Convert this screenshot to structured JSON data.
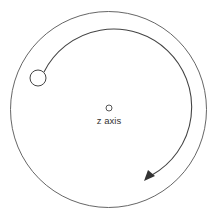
{
  "diagram": {
    "title": "",
    "axis_label": "z axis",
    "colors": {
      "stroke": "#444444",
      "background": "#ffffff",
      "text": "#333333"
    },
    "elements": {
      "outer_circle": {
        "cx": 108.5,
        "cy": 109.5,
        "r": 98
      },
      "center_point": {
        "cx": 109,
        "cy": 108,
        "r": 3
      },
      "moving_point": {
        "cx": 38,
        "cy": 78,
        "r": 8
      },
      "rotation_arc": {
        "direction": "clockwise",
        "cx": 108,
        "cy": 111,
        "r": 78
      }
    }
  }
}
